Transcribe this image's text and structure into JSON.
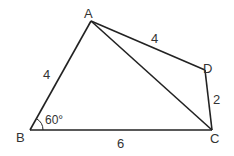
{
  "diagram": {
    "type": "quadrilateral-geometry",
    "points": {
      "A": {
        "label": "A",
        "x": 91,
        "y": 21
      },
      "B": {
        "label": "B",
        "x": 30,
        "y": 130
      },
      "C": {
        "label": "C",
        "x": 212,
        "y": 130
      },
      "D": {
        "label": "D",
        "x": 205,
        "y": 70
      }
    },
    "edges": [
      {
        "from": "A",
        "to": "B",
        "length_label": "4"
      },
      {
        "from": "B",
        "to": "C",
        "length_label": "6"
      },
      {
        "from": "C",
        "to": "D",
        "length_label": "2"
      },
      {
        "from": "D",
        "to": "A",
        "length_label": "4"
      },
      {
        "from": "A",
        "to": "C",
        "length_label": ""
      }
    ],
    "angle": {
      "vertex": "B",
      "label": "60°"
    },
    "labels": {
      "A": "A",
      "B": "B",
      "C": "C",
      "D": "D",
      "AB": "4",
      "BC": "6",
      "CD": "2",
      "DA": "4",
      "angleB": "60°"
    },
    "colors": {
      "stroke": "#222222",
      "text": "#333333"
    }
  }
}
